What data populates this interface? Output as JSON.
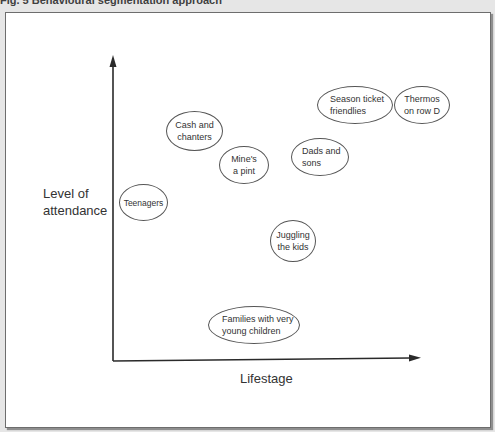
{
  "figure": {
    "caption": "Fig. 5 Behavioural segmentation approach"
  },
  "axes": {
    "y_label": "Level of attendance",
    "x_label": "Lifestage"
  },
  "segments": [
    {
      "label": "Cash and chanters",
      "lines": [
        "Cash and",
        "chanters"
      ]
    },
    {
      "label": "Mine's a pint",
      "lines": [
        "Mine's",
        "a pint"
      ]
    },
    {
      "label": "Teenagers",
      "lines": [
        "Teenagers"
      ]
    },
    {
      "label": "Dads and sons",
      "lines": [
        "Dads and",
        "sons"
      ]
    },
    {
      "label": "Season ticket friendlies",
      "lines": [
        "Season ticket",
        "friendlies"
      ]
    },
    {
      "label": "Thermos on row D",
      "lines": [
        "Thermos",
        "on row D"
      ]
    },
    {
      "label": "Juggling the kids",
      "lines": [
        "Juggling",
        "the kids"
      ]
    },
    {
      "label": "Families with very young children",
      "lines": [
        "Families with very",
        "young children"
      ]
    }
  ],
  "colors": {
    "axis": "#2a2a2a",
    "ellipse_border": "#555555",
    "background": "#ffffff"
  }
}
